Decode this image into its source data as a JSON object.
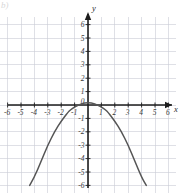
{
  "figure": {
    "corner_label": "b)",
    "x_axis_name": "x",
    "y_axis_name": "y"
  },
  "chart_data": {
    "type": "line",
    "title": "",
    "xlabel": "x",
    "ylabel": "y",
    "grid": true,
    "legend": false,
    "xlim": [
      -6.6,
      6.6
    ],
    "ylim": [
      -6.6,
      6.6
    ],
    "xticks": [
      -6,
      -5,
      -4,
      -3,
      -2,
      -1,
      0,
      1,
      2,
      3,
      4,
      5,
      6
    ],
    "yticks": [
      -6,
      -5,
      -4,
      -3,
      -2,
      -1,
      0,
      1,
      2,
      3,
      4,
      5,
      6
    ],
    "xtick_labels": [
      "-6",
      "-5",
      "-4",
      "-3",
      "-2",
      "-1",
      "0",
      "1",
      "2",
      "3",
      "4",
      "5",
      "6"
    ],
    "ytick_labels": [
      "-6",
      "-5",
      "-4",
      "-3",
      "-2",
      "-1",
      "0",
      "1",
      "2",
      "3",
      "4",
      "5",
      "6"
    ],
    "origin_label": "0",
    "curve": {
      "name": "downward parabola",
      "shape": "parabola",
      "opens": "down",
      "vertex": [
        0,
        0.2
      ],
      "roots": [
        -1.3,
        1.3
      ],
      "color": "#555555",
      "x": [
        -4.35,
        -4.0,
        -3.5,
        -3.0,
        -2.5,
        -2.0,
        -1.5,
        -1.3,
        -1.0,
        -0.5,
        0,
        0.5,
        1.0,
        1.3,
        1.5,
        2.0,
        2.5,
        3.0,
        3.5,
        4.0,
        4.35
      ],
      "y": [
        -6.0,
        -5.4,
        -4.2,
        -3.0,
        -2.0,
        -1.2,
        -0.55,
        -0.35,
        -0.15,
        0.1,
        0.2,
        0.1,
        -0.15,
        -0.35,
        -0.55,
        -1.2,
        -2.0,
        -3.0,
        -4.2,
        -5.4,
        -6.0
      ]
    }
  }
}
